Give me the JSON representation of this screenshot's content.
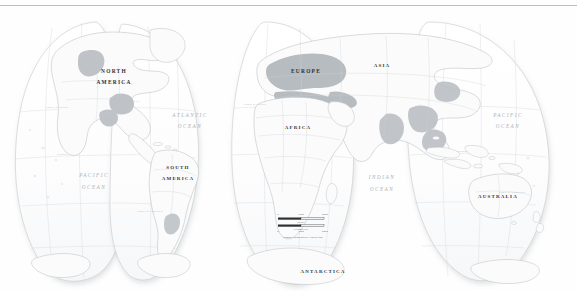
{
  "document": {
    "title": "World Map",
    "map_type": "Goode Homolosine interrupted world map",
    "background_color": "#ffffff"
  },
  "colors": {
    "land_fill": "#fbfbfb",
    "land_stroke": "#b9bec2",
    "highlight_fill": "#b9bec3",
    "highlight_fill_dark": "#a9aeb3",
    "ocean_fill": "#fdfdfd",
    "graticule": "#d7dade",
    "lobe_outline": "#c6cacd",
    "label_dark": "#2e3134",
    "label_ocean": "#a9b0b6",
    "rule": "#b9bcc0"
  },
  "continent_labels": [
    {
      "name": "north-america",
      "text": "NORTH AMERICA",
      "line1": "NORTH",
      "line2": "AMERICA",
      "x": 118,
      "y": 68
    },
    {
      "name": "south-america",
      "text": "SOUTH AMERICA",
      "line1": "SOUTH",
      "line2": "AMERICA",
      "x": 181,
      "y": 162
    },
    {
      "name": "europe",
      "text": "EUROPE",
      "x": 306,
      "y": 68
    },
    {
      "name": "africa",
      "text": "AFRICA",
      "x": 300,
      "y": 122
    },
    {
      "name": "asia",
      "text": "ASIA",
      "x": 382,
      "y": 62
    },
    {
      "name": "australia",
      "text": "AUSTRALIA",
      "x": 499,
      "y": 191
    },
    {
      "name": "antarctica",
      "text": "ANTARCTICA",
      "x": 325,
      "y": 265
    }
  ],
  "ocean_labels": [
    {
      "name": "atlantic-ocean",
      "line1": "ATLANTIC",
      "line2": "OCEAN",
      "x": 190,
      "y": 112
    },
    {
      "name": "pacific-ocean-left",
      "line1": "PACIFIC",
      "line2": "OCEAN",
      "x": 98,
      "y": 173
    },
    {
      "name": "indian-ocean",
      "line1": "INDIAN",
      "line2": "OCEAN",
      "x": 382,
      "y": 175
    },
    {
      "name": "pacific-ocean-right",
      "line1": "PACIFIC",
      "line2": "OCEAN",
      "x": 508,
      "y": 112
    }
  ],
  "graticule_labels": [
    {
      "name": "tropic-of-cancer-left",
      "text": "Tropic of Cancer",
      "x": 57,
      "y": 104
    },
    {
      "name": "equator-left",
      "text": "Equator",
      "x": 62,
      "y": 151
    },
    {
      "name": "tropic-of-capricorn-left",
      "text": "Tropic of Capricorn",
      "x": 200,
      "y": 208
    },
    {
      "name": "tropic-of-cancer-right",
      "text": "Tropic of Cancer",
      "x": 240,
      "y": 104
    },
    {
      "name": "equator-right",
      "text": "Equator",
      "x": 455,
      "y": 151
    },
    {
      "name": "tropic-of-capricorn-right",
      "text": "Tropic of Capricorn",
      "x": 510,
      "y": 188
    }
  ],
  "scale_bar": {
    "name": "scale-bar",
    "miles_label": "Miles",
    "kilometers_label": "Kilometers",
    "miles_ticks": [
      "0",
      "1000",
      "2000"
    ],
    "kilometers_ticks": [
      "0",
      "1000",
      "2000"
    ],
    "projection_caption": "Goode Homolosine Projection",
    "x": 304,
    "y": 221
  }
}
